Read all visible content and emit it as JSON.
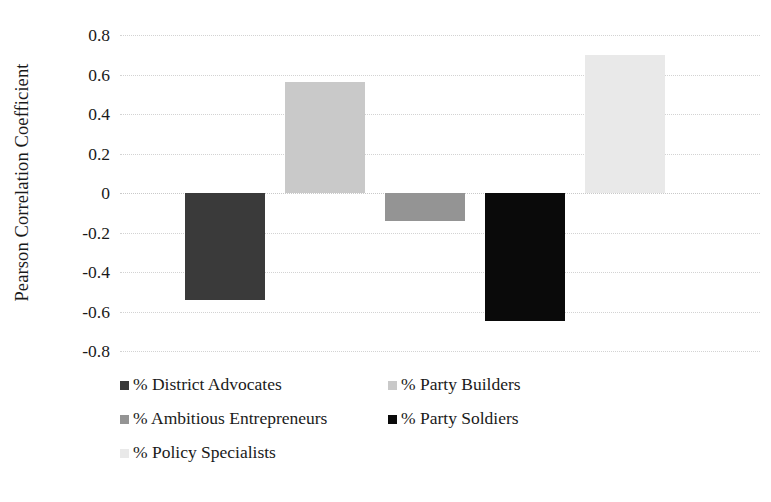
{
  "chart_data": {
    "type": "bar",
    "title": "",
    "xlabel": "",
    "ylabel": "Pearson Correlation Coefficient",
    "ylim": [
      -0.8,
      0.8
    ],
    "yticks": [
      "0.8",
      "0.6",
      "0.4",
      "0.2",
      "0",
      "-0.2",
      "-0.4",
      "-0.6",
      "-0.8"
    ],
    "ytick_values": [
      0.8,
      0.6,
      0.4,
      0.2,
      0,
      -0.2,
      -0.4,
      -0.6,
      -0.8
    ],
    "grid": true,
    "grid_style": "dotted-horizontal",
    "legend_position": "bottom",
    "categories": [
      "% District Advocates",
      "% Party Builders",
      "% Ambitious Entrepreneurs",
      "% Party Soldiers",
      "% Policy Specialists"
    ],
    "values": [
      -0.54,
      0.56,
      -0.14,
      -0.65,
      0.7
    ],
    "colors": [
      "#3a3a3a",
      "#c9c9c9",
      "#949494",
      "#0a0a0a",
      "#e9e9e9"
    ],
    "series": [
      {
        "name": "Pearson Correlation Coefficient",
        "values": [
          -0.54,
          0.56,
          -0.14,
          -0.65,
          0.7
        ]
      }
    ]
  },
  "legend": {
    "rows": [
      [
        {
          "label": "% District Advocates",
          "color": "#3a3a3a"
        },
        {
          "label": "% Party Builders",
          "color": "#c9c9c9"
        }
      ],
      [
        {
          "label": "% Ambitious Entrepreneurs",
          "color": "#949494"
        },
        {
          "label": "% Party Soldiers",
          "color": "#0a0a0a"
        }
      ],
      [
        {
          "label": "% Policy Specialists",
          "color": "#e9e9e9"
        }
      ]
    ]
  }
}
